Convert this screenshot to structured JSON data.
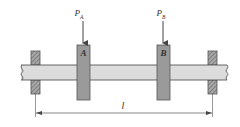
{
  "diagram": {
    "colors": {
      "shaft_fill": "#dcdcdc",
      "outline": "#555555",
      "disk_fill": "#9a9a9a",
      "bearing_fill": "#8c8c8c",
      "arrow": "#444444",
      "text": "#333333"
    },
    "loads": [
      {
        "symbol": "P",
        "subscript": "A",
        "target": "disk A"
      },
      {
        "symbol": "P",
        "subscript": "B",
        "target": "disk B"
      }
    ],
    "disks": [
      {
        "label": "A"
      },
      {
        "label": "B"
      }
    ],
    "supports": [
      {
        "name": "left bearing"
      },
      {
        "name": "right bearing"
      }
    ],
    "dimension": {
      "label": "l",
      "span": "between bearings"
    }
  }
}
